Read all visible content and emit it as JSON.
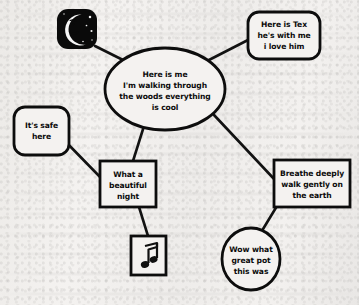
{
  "canvas": {
    "width": 359,
    "height": 305,
    "background_color": "#f2f0ee",
    "ink_color": "#0d0d0d",
    "title": "Here is me I'm walking through the woods everything is cool"
  },
  "nodes": [
    {
      "id": "moon-tile",
      "kind": "icon-tile",
      "icon": "crescent-moon-face-icon",
      "lines": [],
      "x": 57,
      "y": 9,
      "w": 40,
      "h": 40
    },
    {
      "id": "center",
      "kind": "ellipse",
      "lines": [
        "Here is me",
        "I'm walking through",
        "the woods everything",
        "is cool"
      ],
      "cx": 165,
      "cy": 89,
      "rx": 60,
      "ry": 41
    },
    {
      "id": "tex",
      "kind": "rounded-rect",
      "lines": [
        "Here is Tex",
        "he's with me",
        "i love him"
      ],
      "x": 248,
      "y": 12,
      "w": 72,
      "h": 47
    },
    {
      "id": "safe",
      "kind": "rounded-rect",
      "lines": [
        "It's safe",
        "here"
      ],
      "x": 14,
      "y": 107,
      "w": 55,
      "h": 48
    },
    {
      "id": "night",
      "kind": "rect",
      "lines": [
        "What a",
        "beautiful",
        "night"
      ],
      "x": 100,
      "y": 161,
      "w": 56,
      "h": 46
    },
    {
      "id": "breathe",
      "kind": "rect",
      "lines": [
        "Breathe deeply",
        "walk gently on",
        "the earth"
      ],
      "x": 274,
      "y": 160,
      "w": 76,
      "h": 47
    },
    {
      "id": "pot",
      "kind": "ellipse",
      "lines": [
        "Wow what",
        "great pot",
        "this was"
      ],
      "cx": 251,
      "cy": 259,
      "rx": 29,
      "ry": 31
    },
    {
      "id": "music-tile",
      "kind": "icon-box",
      "icon": "music-note-icon",
      "lines": [],
      "x": 131,
      "y": 236,
      "w": 35,
      "h": 39
    }
  ],
  "edges": [
    {
      "id": "moon-to-center",
      "from": "moon-tile",
      "to": "center",
      "x1": 95,
      "y1": 46,
      "x2": 127,
      "y2": 62
    },
    {
      "id": "center-to-tex",
      "from": "center",
      "to": "tex",
      "x1": 207,
      "y1": 61,
      "x2": 248,
      "y2": 40
    },
    {
      "id": "safe-to-night",
      "from": "safe",
      "to": "night",
      "x1": 64,
      "y1": 140,
      "x2": 101,
      "y2": 178
    },
    {
      "id": "center-to-night",
      "from": "center",
      "to": "night",
      "x1": 144,
      "y1": 126,
      "x2": 133,
      "y2": 161
    },
    {
      "id": "center-to-breathe",
      "from": "center",
      "to": "breathe",
      "x1": 214,
      "y1": 115,
      "x2": 275,
      "y2": 180
    },
    {
      "id": "breathe-to-pot",
      "from": "breathe",
      "to": "pot",
      "x1": 277,
      "y1": 206,
      "x2": 260,
      "y2": 234
    },
    {
      "id": "night-to-music",
      "from": "night",
      "to": "music",
      "x1": 139,
      "y1": 207,
      "x2": 148,
      "y2": 236
    }
  ],
  "icons": {
    "moon": {
      "name": "crescent-moon-face-icon",
      "glyph": "moon-with-face"
    },
    "music": {
      "name": "music-note-icon",
      "glyph": "♫"
    }
  }
}
